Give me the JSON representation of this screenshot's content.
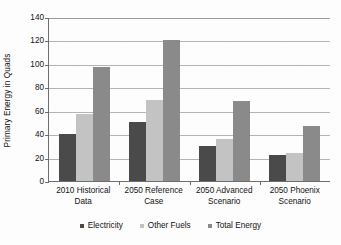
{
  "chart_data": {
    "type": "bar",
    "title": "",
    "xlabel": "",
    "ylabel": "Primary Energy in Quads",
    "categories": [
      "2010 Historical Data",
      "2050 Reference Case",
      "2050 Advanced Scenario",
      "2050 Phoenix Scenario"
    ],
    "series": [
      {
        "name": "Electricity",
        "color": "#4a4a4a",
        "values": [
          40,
          50,
          30,
          22
        ]
      },
      {
        "name": "Other Fuels",
        "color": "#c3c3c3",
        "values": [
          57,
          69,
          36,
          24
        ]
      },
      {
        "name": "Total Energy",
        "color": "#8a8a8a",
        "values": [
          97,
          120,
          68,
          47
        ]
      }
    ],
    "ylim": [
      0,
      140
    ],
    "ytick_step": 20,
    "yticks": [
      0,
      20,
      40,
      60,
      80,
      100,
      120,
      140
    ],
    "ytick_labels": [
      "0",
      "20",
      "40",
      "60",
      "80",
      "100",
      "120",
      "140"
    ],
    "grid": "horizontal",
    "legend_position": "bottom",
    "legend_entries": [
      "Electricity",
      "Other Fuels",
      "Total Energy"
    ]
  }
}
